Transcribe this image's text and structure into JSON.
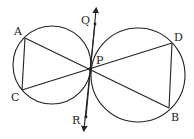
{
  "diagram": {
    "type": "geometry",
    "points": {
      "A": {
        "label": "A",
        "x": 25,
        "y": 38
      },
      "C": {
        "label": "C",
        "x": 22,
        "y": 90
      },
      "P": {
        "label": "P",
        "x": 90,
        "y": 69
      },
      "D": {
        "label": "D",
        "x": 172,
        "y": 43
      },
      "B": {
        "label": "B",
        "x": 169,
        "y": 108
      },
      "Q": {
        "label": "Q",
        "x": 95,
        "y": 24
      },
      "R": {
        "label": "R",
        "x": 86,
        "y": 117
      }
    },
    "circles": [
      {
        "name": "left-circle",
        "cx": 52,
        "cy": 65,
        "r": 39
      },
      {
        "name": "right-circle",
        "cx": 138,
        "cy": 75,
        "r": 47
      }
    ],
    "segments": [
      "AC",
      "AB",
      "CD",
      "DB"
    ],
    "tangent_line": {
      "through": "P",
      "ends": [
        "Q",
        "R"
      ],
      "arrows": true
    },
    "colors": {
      "stroke": "#222222",
      "background": "#ffffff"
    }
  },
  "labels": {
    "A": "A",
    "C": "C",
    "P": "P",
    "D": "D",
    "B": "B",
    "Q": "Q",
    "R": "R"
  }
}
